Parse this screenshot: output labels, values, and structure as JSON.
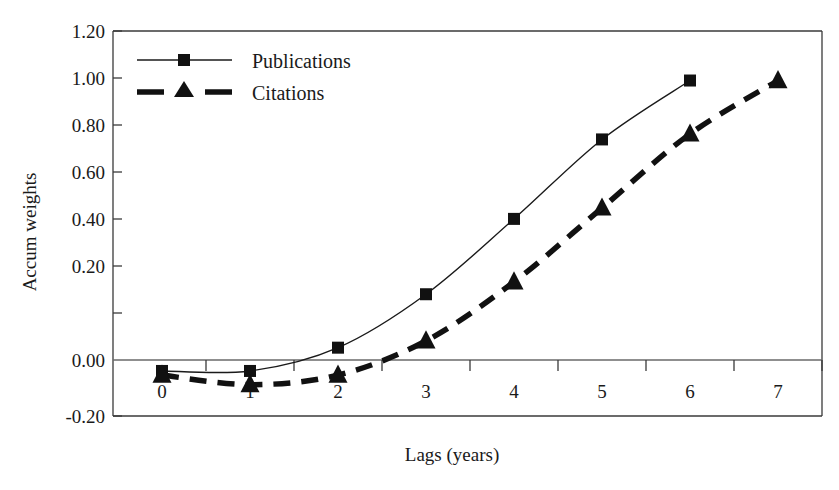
{
  "chart_data": {
    "type": "line",
    "title": "",
    "xlabel": "Lags (years)",
    "ylabel": "Accum weights",
    "x": [
      0,
      1,
      2,
      3,
      4,
      5,
      6,
      7
    ],
    "xticklabels": [
      "0",
      "1",
      "2",
      "3",
      "4",
      "5",
      "6",
      "7"
    ],
    "yticklabels": [
      "1.20",
      "1.00",
      "0.80",
      "0.60",
      "0.40",
      "0.20",
      "0.00",
      "-0.20"
    ],
    "yticks": [
      1.2,
      1.0,
      0.8,
      0.6,
      0.4,
      0.2,
      0.0,
      -0.2
    ],
    "xlim": [
      -0.35,
      7.5
    ],
    "ylim": [
      -0.2,
      1.2
    ],
    "grid": false,
    "legend_position": "top-left",
    "series": [
      {
        "name": "Publications",
        "marker": "square",
        "linestyle": "solid",
        "color": "#111111",
        "x": [
          0,
          1,
          2,
          3,
          4,
          5,
          6
        ],
        "values": [
          -0.04,
          -0.04,
          0.045,
          0.24,
          0.515,
          0.805,
          1.02
        ]
      },
      {
        "name": "Citations",
        "marker": "triangle",
        "linestyle": "dashed",
        "color": "#111111",
        "x": [
          0,
          1,
          2,
          3,
          4,
          5,
          6,
          7
        ],
        "values": [
          -0.055,
          -0.09,
          -0.055,
          0.07,
          0.285,
          0.555,
          0.825,
          1.02
        ]
      }
    ]
  },
  "legend": {
    "items": [
      {
        "label": "Publications",
        "marker": "square-marker",
        "style": "solid-line"
      },
      {
        "label": "Citations",
        "marker": "triangle-marker",
        "style": "dashed-line"
      }
    ]
  },
  "axes": {
    "y_title": "Accum weights",
    "x_title": "Lags (years)"
  }
}
